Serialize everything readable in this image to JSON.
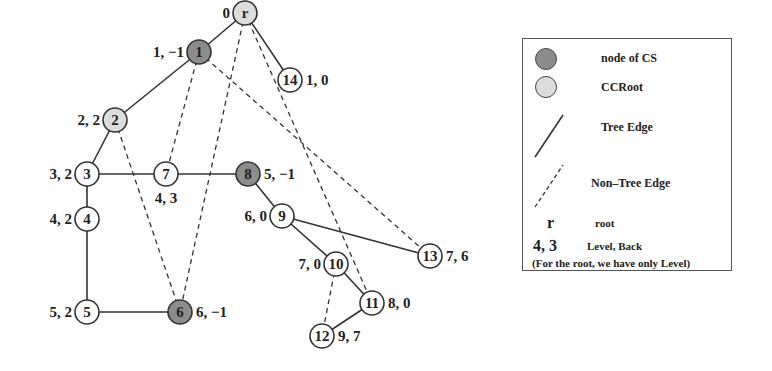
{
  "figure": {
    "type": "graph-dfs-tree",
    "colors": {
      "cs_node_fill": "#8c8c8c",
      "ccroot_fill": "#dcdcdc",
      "plain_node_fill": "#ffffff",
      "edge_color": "#333333"
    },
    "nodes": [
      {
        "id": "r",
        "label": "r",
        "kind": "ccroot",
        "x": 245,
        "y": 13,
        "annot": "0",
        "annot_pos": "left"
      },
      {
        "id": "1",
        "label": "1",
        "kind": "cs",
        "x": 199,
        "y": 52,
        "annot": "1, −1",
        "annot_pos": "left"
      },
      {
        "id": "14",
        "label": "14",
        "kind": "plain",
        "x": 290,
        "y": 80,
        "annot": "1, 0",
        "annot_pos": "right"
      },
      {
        "id": "2",
        "label": "2",
        "kind": "ccroot",
        "x": 115,
        "y": 120,
        "annot": "2, 2",
        "annot_pos": "left"
      },
      {
        "id": "3",
        "label": "3",
        "kind": "plain",
        "x": 87,
        "y": 174,
        "annot": "3, 2",
        "annot_pos": "left"
      },
      {
        "id": "7",
        "label": "7",
        "kind": "plain",
        "x": 166,
        "y": 174,
        "annot": "4, 3",
        "annot_pos": "below"
      },
      {
        "id": "8",
        "label": "8",
        "kind": "cs",
        "x": 248,
        "y": 174,
        "annot": "5, −1",
        "annot_pos": "right"
      },
      {
        "id": "4",
        "label": "4",
        "kind": "plain",
        "x": 87,
        "y": 219,
        "annot": "4, 2",
        "annot_pos": "left"
      },
      {
        "id": "9",
        "label": "9",
        "kind": "plain",
        "x": 282,
        "y": 216,
        "annot": "6, 0",
        "annot_pos": "left"
      },
      {
        "id": "13",
        "label": "13",
        "kind": "plain",
        "x": 430,
        "y": 256,
        "annot": "7, 6",
        "annot_pos": "right"
      },
      {
        "id": "10",
        "label": "10",
        "kind": "plain",
        "x": 336,
        "y": 264,
        "annot": "7, 0",
        "annot_pos": "left"
      },
      {
        "id": "11",
        "label": "11",
        "kind": "plain",
        "x": 372,
        "y": 303,
        "annot": "8, 0",
        "annot_pos": "right"
      },
      {
        "id": "5",
        "label": "5",
        "kind": "plain",
        "x": 87,
        "y": 312,
        "annot": "5, 2",
        "annot_pos": "left"
      },
      {
        "id": "6",
        "label": "6",
        "kind": "cs",
        "x": 180,
        "y": 312,
        "annot": "6, −1",
        "annot_pos": "right"
      },
      {
        "id": "12",
        "label": "12",
        "kind": "plain",
        "x": 322,
        "y": 336,
        "annot": "9, 7",
        "annot_pos": "right"
      }
    ],
    "tree_edges": [
      [
        "r",
        "1"
      ],
      [
        "r",
        "14"
      ],
      [
        "1",
        "2"
      ],
      [
        "2",
        "3"
      ],
      [
        "3",
        "4"
      ],
      [
        "4",
        "5"
      ],
      [
        "5",
        "6"
      ],
      [
        "3",
        "7"
      ],
      [
        "7",
        "8"
      ],
      [
        "8",
        "9"
      ],
      [
        "9",
        "10"
      ],
      [
        "9",
        "13"
      ],
      [
        "10",
        "11"
      ],
      [
        "11",
        "12"
      ]
    ],
    "non_tree_edges": [
      [
        "1",
        "7"
      ],
      [
        "r",
        "6"
      ],
      [
        "r",
        "11"
      ],
      [
        "1",
        "13"
      ],
      [
        "2",
        "6"
      ],
      [
        "10",
        "12"
      ]
    ]
  },
  "legend": {
    "items": [
      {
        "symbol": "dark-circle",
        "label": "node of CS"
      },
      {
        "symbol": "light-circle",
        "label": "CCRoot"
      },
      {
        "symbol": "solid-line",
        "label": "Tree Edge"
      },
      {
        "symbol": "dashed-line",
        "label": "Non–Tree Edge"
      },
      {
        "symbol": "r",
        "label": "root"
      },
      {
        "symbol": "4, 3",
        "label": "Level, Back"
      }
    ],
    "note": "(For the root, we have only Level)"
  }
}
